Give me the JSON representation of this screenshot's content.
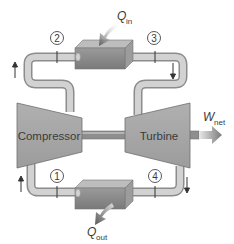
{
  "diagram": {
    "type": "gas-turbine-brayton-cycle-schematic",
    "components": {
      "compressor": {
        "label": "Compressor"
      },
      "turbine": {
        "label": "Turbine"
      },
      "heater": {
        "heat_label_main": "Q",
        "heat_label_sub": "in"
      },
      "cooler": {
        "heat_label_main": "Q",
        "heat_label_sub": "out"
      }
    },
    "work": {
      "label_main": "W",
      "label_sub": "net"
    },
    "states": [
      {
        "id": "1",
        "label": "1"
      },
      {
        "id": "2",
        "label": "2"
      },
      {
        "id": "3",
        "label": "3"
      },
      {
        "id": "4",
        "label": "4"
      }
    ],
    "flow_arrows": [
      "up-left-top",
      "down-right-top",
      "up-left-bottom",
      "down-right-bottom"
    ],
    "colors": {
      "pipe_fill": "#c9c9c9",
      "pipe_edge": "#8c8c8c",
      "machine_fill": "#a9a9a9",
      "machine_edge": "#6e6e6e",
      "box_front": "#8f8f8f",
      "box_top": "#bdbdbd",
      "text": "#3a3a3a"
    }
  }
}
